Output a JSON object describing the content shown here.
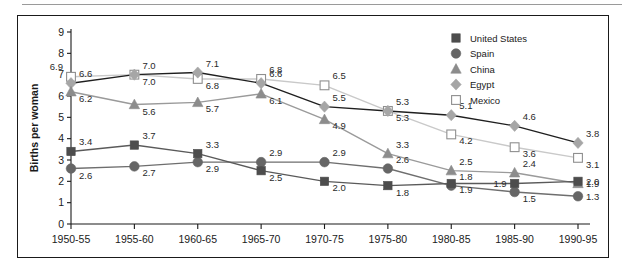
{
  "figure": {
    "ylabel": "Births per woman"
  },
  "legend": {
    "position": "top-right",
    "items": [
      {
        "label": "United States",
        "marker": "square-filled-icon",
        "color": "#4d4d4d"
      },
      {
        "label": "Spain",
        "marker": "circle-filled-icon",
        "color": "#666666"
      },
      {
        "label": "China",
        "marker": "triangle-filled-icon",
        "color": "#8c8c8c"
      },
      {
        "label": "Egypt",
        "marker": "diamond-filled-icon",
        "color": "#a6a6a6"
      },
      {
        "label": "Mexico",
        "marker": "square-open-icon",
        "color": "#ffffff"
      }
    ]
  },
  "chart_data": {
    "type": "line",
    "title": "",
    "xlabel": "",
    "ylabel": "Births per woman",
    "ylim": [
      0,
      9
    ],
    "yticks": [
      "0",
      "1",
      "2",
      "3",
      "4",
      "5",
      "6",
      "7",
      "8",
      "9"
    ],
    "grid": false,
    "legend_position": "top-right",
    "categories": [
      "1950-55",
      "1955-60",
      "1960-65",
      "1965-70",
      "1970-75",
      "1975-80",
      "1980-85",
      "1985-90",
      "1990-95"
    ],
    "series": [
      {
        "name": "United States",
        "color": "#4d4d4d",
        "marker": "square",
        "values": [
          3.4,
          3.7,
          3.3,
          2.5,
          2.0,
          1.8,
          1.9,
          1.9,
          2.0
        ],
        "label_pos": [
          "above-right",
          "above-right",
          "above-right",
          "below-right",
          "below-right",
          "below-right",
          "below-right",
          "left",
          "right"
        ]
      },
      {
        "name": "Spain",
        "color": "#666666",
        "marker": "circle",
        "values": [
          2.6,
          2.7,
          2.9,
          2.9,
          2.9,
          2.6,
          1.8,
          1.5,
          1.3
        ],
        "label_pos": [
          "below-right",
          "below-right",
          "below-right",
          "above-right",
          "above-right",
          "above-right",
          "above-right",
          "below-right",
          "right"
        ]
      },
      {
        "name": "China",
        "color": "#8c8c8c",
        "marker": "triangle",
        "values": [
          6.2,
          5.6,
          5.7,
          6.1,
          4.9,
          3.3,
          2.5,
          2.4,
          1.9
        ],
        "label_pos": [
          "below-right",
          "below-right",
          "below-right",
          "below-right",
          "below-right",
          "above-right",
          "above-right",
          "above-right",
          "right"
        ]
      },
      {
        "name": "Egypt",
        "color": "#a6a6a6",
        "marker": "diamond",
        "values": [
          6.6,
          7.0,
          7.1,
          6.6,
          5.5,
          5.3,
          5.1,
          4.6,
          3.8
        ],
        "label_pos": [
          "above-right",
          "above-right",
          "above-right",
          "above-right",
          "above-right",
          "below-right",
          "above-right",
          "above-right",
          "above-right"
        ]
      },
      {
        "name": "Mexico",
        "color": "#ffffff",
        "marker": "square-open",
        "values": [
          6.9,
          7.0,
          6.8,
          6.8,
          6.5,
          5.3,
          4.2,
          3.6,
          3.1
        ],
        "label_pos": [
          "above-left",
          "below-right",
          "below-right",
          "above-right",
          "above-right",
          "above-right",
          "below-right",
          "below-right",
          "below-right"
        ]
      }
    ]
  }
}
